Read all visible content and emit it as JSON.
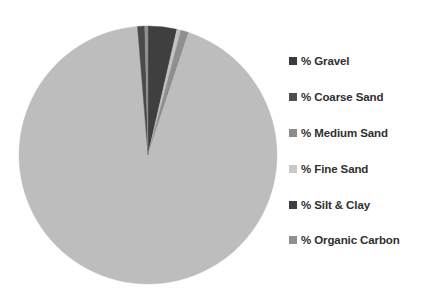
{
  "chart_data": {
    "type": "pie",
    "title": "",
    "legend_position": "right",
    "grid": false,
    "start_angle_deg": 0,
    "direction": "clockwise",
    "categories": [
      "% Gravel",
      "% Coarse Sand",
      "% Medium Sand",
      "% Fine Sand",
      "% Silt & Clay",
      "% Organic Carbon"
    ],
    "values": [
      3.6,
      0.5,
      1.0,
      93.6,
      0.9,
      0.4
    ],
    "units": "percent",
    "colors": [
      "#3f3f3f",
      "#c2c2c2",
      "#8f8f8f",
      "#bdbdbd",
      "#4a4a4a",
      "#909090"
    ],
    "slices": [
      {
        "label": "% Gravel",
        "value": 3.6,
        "color": "#3f3f3f"
      },
      {
        "label": "% Coarse Sand",
        "value": 0.5,
        "color": "#c2c2c2"
      },
      {
        "label": "% Medium Sand",
        "value": 1.0,
        "color": "#8f8f8f"
      },
      {
        "label": "% Fine Sand",
        "value": 93.6,
        "color": "#bdbdbd"
      },
      {
        "label": "% Silt & Clay",
        "value": 0.9,
        "color": "#4a4a4a"
      },
      {
        "label": "% Organic Carbon",
        "value": 0.4,
        "color": "#909090"
      }
    ],
    "geometry": {
      "center_x": 148,
      "center_y": 155,
      "radius": 129
    }
  },
  "legend": {
    "items": [
      {
        "label": "% Gravel",
        "swatch": "#3a3a3a",
        "y": 8
      },
      {
        "label": "% Coarse Sand",
        "swatch": "#4e4e4e",
        "y": 44
      },
      {
        "label": "% Medium Sand",
        "swatch": "#8b8b8b",
        "y": 80
      },
      {
        "label": "% Fine Sand",
        "swatch": "#c9c9c9",
        "y": 116
      },
      {
        "label": "% Silt & Clay",
        "swatch": "#3f3f3f",
        "y": 152
      },
      {
        "label": "% Organic Carbon",
        "swatch": "#8f8f8f",
        "y": 187
      }
    ]
  }
}
